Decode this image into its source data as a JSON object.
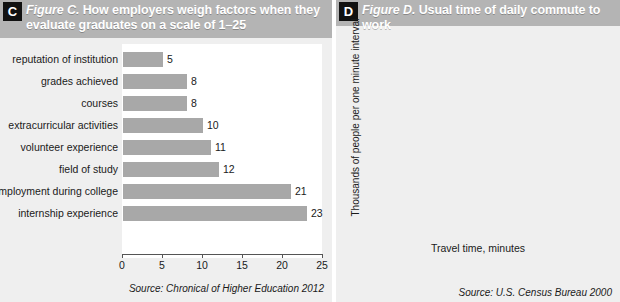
{
  "panels": {
    "c": {
      "badge": "C",
      "figure_label": "Figure C.",
      "title": "How employers weigh factors when they evaluate graduates on a scale of 1–25",
      "source": "Source: Chronical of Higher Education 2012"
    },
    "d": {
      "badge": "D",
      "figure_label": "Figure D.",
      "title": "Usual time of daily commute to work",
      "source": "Source: U.S. Census Bureau 2000"
    }
  },
  "colors": {
    "bar": "#a8a8a8",
    "panel_bg": "#efefef",
    "header_bg": "#b4b4b4",
    "badge_bg": "#111111",
    "plot_bg": "#ffffff",
    "axis": "#444444",
    "grid": "#d8d8d8"
  },
  "chart_data": [
    {
      "type": "bar",
      "orientation": "horizontal",
      "title": "How employers weigh factors when they evaluate graduates on a scale of 1–25",
      "xlabel": "",
      "ylabel": "",
      "xlim": [
        0,
        25
      ],
      "xticks": [
        0,
        5,
        10,
        15,
        20,
        25
      ],
      "grid": false,
      "legend": "none",
      "categories": [
        "reputation of institution",
        "grades achieved",
        "courses",
        "extracurricular activities",
        "volunteer experience",
        "field of study",
        "employment during college",
        "internship experience"
      ],
      "values": [
        5,
        8,
        8,
        10,
        11,
        12,
        21,
        23
      ],
      "data_labels": [
        "5",
        "8",
        "8",
        "10",
        "11",
        "12",
        "21",
        "23"
      ],
      "source": "Source: Chronical of Higher Education 2012"
    },
    {
      "type": "bar",
      "subtype": "histogram",
      "orientation": "vertical",
      "title": "Usual time of daily commute to work",
      "xlabel": "Travel time, minutes",
      "ylabel": "Thousands of people per one minute interval",
      "xlim": [
        0,
        155
      ],
      "ylim": [
        0,
        4200
      ],
      "xticks": [
        0,
        50,
        100,
        150
      ],
      "yticks": [
        0,
        1000,
        2000,
        3000,
        4000
      ],
      "grid": true,
      "legend": "none",
      "bin_edges": [
        0,
        5,
        10,
        15,
        20,
        25,
        30,
        35,
        40,
        45,
        50,
        55,
        60,
        65,
        75,
        90,
        155
      ],
      "values": [
        850,
        2750,
        3450,
        3800,
        3600,
        1600,
        3350,
        1000,
        830,
        830,
        250,
        250,
        250,
        250,
        60,
        60
      ],
      "source": "Source: U.S. Census Bureau 2000"
    }
  ]
}
